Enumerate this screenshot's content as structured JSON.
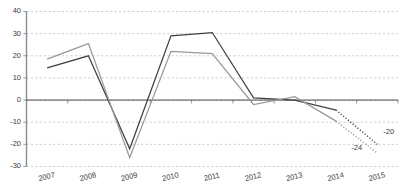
{
  "chart_data": {
    "type": "line",
    "title": "",
    "subtitle": "",
    "xlabel": "",
    "ylabel": "",
    "categories": [
      "2007",
      "2008",
      "2009",
      "2010",
      "2011",
      "2012",
      "2013",
      "2014",
      "2015"
    ],
    "ylim": [
      -30,
      40
    ],
    "yticks": [
      40,
      30,
      20,
      10,
      0,
      -10,
      -20,
      -30
    ],
    "ytick_labels": [
      "40",
      "30",
      "20",
      "10",
      "0",
      "-10",
      "-20",
      "-30"
    ],
    "grid": true,
    "grid_style": "dashed-horizontal",
    "legend": "none",
    "series": [
      {
        "name": "dark-series",
        "color": "#404040",
        "values": [
          14.5,
          20.0,
          -22.0,
          29.0,
          30.5,
          1.0,
          0.0,
          -4.5,
          -20.0
        ],
        "dashed_from_index": 7,
        "end_label": "-20"
      },
      {
        "name": "gray-series",
        "color": "#999999",
        "values": [
          18.5,
          25.5,
          -26.0,
          22.0,
          21.0,
          -2.0,
          1.5,
          -9.5,
          -24.0
        ],
        "dashed_from_index": 7,
        "end_label": "-24"
      }
    ],
    "annotations": [
      {
        "text": "-20",
        "series": "dark-series",
        "at_category": "2015"
      },
      {
        "text": "-24",
        "series": "gray-series",
        "at_category": "2015"
      }
    ],
    "colors": {
      "dark_series": "#404040",
      "gray_series": "#999999",
      "gridline": "#b9b9b9",
      "axis": "#8a8a8a",
      "zero_line": "#4a4a4a",
      "text": "#3a3a3a",
      "background": "#ffffff"
    }
  }
}
